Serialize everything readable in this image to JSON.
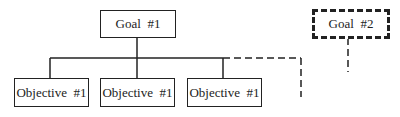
{
  "diagram": {
    "goals": [
      {
        "label": "Goal  #1",
        "style": "solid"
      },
      {
        "label": "Goal  #2",
        "style": "dashed"
      }
    ],
    "objectives": [
      {
        "label": "Objective  #1"
      },
      {
        "label": "Objective  #1"
      },
      {
        "label": "Objective  #1"
      }
    ],
    "colors": {
      "line": "#222222",
      "background": "#ffffff"
    }
  }
}
